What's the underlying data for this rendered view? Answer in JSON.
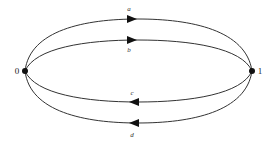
{
  "diagram": {
    "type": "multigraph",
    "vertices": [
      {
        "id": "v0",
        "label": "0",
        "x": 25,
        "y": 71
      },
      {
        "id": "v1",
        "label": "1",
        "x": 252,
        "y": 71
      }
    ],
    "edges": [
      {
        "id": "a",
        "label": "a",
        "from": "0",
        "to": "1",
        "direction": "right"
      },
      {
        "id": "b",
        "label": "b",
        "from": "0",
        "to": "1",
        "direction": "right"
      },
      {
        "id": "c",
        "label": "c",
        "from": "1",
        "to": "0",
        "direction": "left"
      },
      {
        "id": "d",
        "label": "d",
        "from": "1",
        "to": "0",
        "direction": "left"
      }
    ]
  }
}
